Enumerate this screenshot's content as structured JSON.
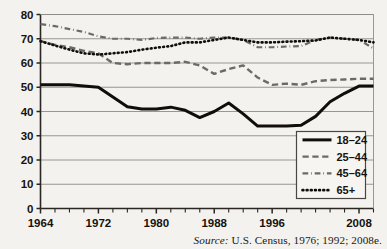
{
  "chart_data": {
    "type": "line",
    "title": "",
    "subtitle": "",
    "xlabel": "",
    "ylabel": "",
    "xlim": [
      1964,
      2010
    ],
    "ylim": [
      0,
      80
    ],
    "grid": true,
    "legend_position": "bottom-right",
    "x": [
      1964,
      1966,
      1968,
      1970,
      1972,
      1974,
      1976,
      1978,
      1980,
      1982,
      1984,
      1986,
      1988,
      1990,
      1992,
      1994,
      1996,
      1998,
      2000,
      2002,
      2004,
      2006,
      2008,
      2010
    ],
    "x_tick_labels": [
      "1964",
      "1972",
      "1980",
      "1988",
      "1996",
      "2008"
    ],
    "x_tick_values": [
      1964,
      1972,
      1980,
      1988,
      1996,
      2008
    ],
    "y_tick_labels": [
      "0",
      "10",
      "20",
      "30",
      "40",
      "50",
      "60",
      "70",
      "80"
    ],
    "y_tick_values": [
      0,
      10,
      20,
      30,
      40,
      50,
      60,
      70,
      80
    ],
    "series": [
      {
        "name": "18–24",
        "style": "solid",
        "color": "#100d0b",
        "width": 3,
        "x": [
          1964,
          1966,
          1968,
          1970,
          1972,
          1974,
          1976,
          1978,
          1980,
          1982,
          1984,
          1986,
          1988,
          1990,
          1992,
          1994,
          1996,
          1998,
          2000,
          2002,
          2004,
          2006,
          2008,
          2010
        ],
        "values": [
          51,
          51,
          51,
          50.5,
          50,
          46,
          42,
          41,
          41,
          41.8,
          40.5,
          37.5,
          40,
          43.5,
          39,
          34,
          34,
          34,
          34.3,
          38,
          44,
          47.5,
          50.5,
          50.5
        ]
      },
      {
        "name": "25–44",
        "style": "dashed",
        "color": "#6d6a66",
        "width": 2.4,
        "x": [
          1964,
          1966,
          1968,
          1970,
          1972,
          1974,
          1976,
          1978,
          1980,
          1982,
          1984,
          1986,
          1988,
          1990,
          1992,
          1994,
          1996,
          1998,
          2000,
          2002,
          2004,
          2006,
          2008,
          2010
        ],
        "values": [
          69,
          67.5,
          66.5,
          65,
          64,
          60,
          59.5,
          60,
          60,
          60,
          60.5,
          59,
          55.5,
          57.5,
          59,
          54,
          51,
          51.5,
          51,
          52.5,
          53,
          53.2,
          53.5,
          53.5
        ]
      },
      {
        "name": "45–64",
        "style": "dashdot",
        "color": "#6d6a66",
        "width": 2.2,
        "x": [
          1964,
          1966,
          1968,
          1970,
          1972,
          1974,
          1976,
          1978,
          1980,
          1982,
          1984,
          1986,
          1988,
          1990,
          1992,
          1994,
          1996,
          1998,
          2000,
          2002,
          2004,
          2006,
          2008,
          2010
        ],
        "values": [
          76,
          75.2,
          74,
          72.8,
          71,
          70,
          70,
          69.5,
          70.3,
          70.5,
          70.5,
          70,
          70.5,
          70.5,
          69.5,
          66.5,
          66.5,
          66.8,
          67,
          69.5,
          70.5,
          70,
          69.5,
          66
        ]
      },
      {
        "name": "65+",
        "style": "dotted",
        "color": "#100d0b",
        "width": 2.6,
        "x": [
          1964,
          1966,
          1968,
          1970,
          1972,
          1974,
          1976,
          1978,
          1980,
          1982,
          1984,
          1986,
          1988,
          1990,
          1992,
          1994,
          1996,
          1998,
          2000,
          2002,
          2004,
          2006,
          2008,
          2010
        ],
        "values": [
          69,
          67.2,
          65.5,
          64,
          63.5,
          64,
          64.5,
          65.5,
          66.3,
          67,
          68.5,
          68.5,
          69.5,
          70.5,
          69.5,
          68.5,
          68.5,
          68.8,
          69,
          69.3,
          70.5,
          70,
          69.5,
          68.5
        ]
      }
    ],
    "legend_entries": [
      "18–24",
      "25–44",
      "45–64",
      "65+"
    ]
  },
  "source": {
    "label": "Source:",
    "text": " U.S. Census, 1976; 1992; 2008e."
  },
  "colors": {
    "background": "#f4f2ee",
    "axis": "#2a2622",
    "grid": "#8f8c88",
    "text": "#16120f"
  }
}
